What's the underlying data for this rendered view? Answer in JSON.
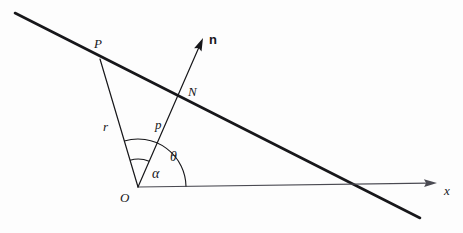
{
  "figure": {
    "type": "geometry-diagram",
    "background_color": "#fdfdfd",
    "stroke_color": "#17171a"
  },
  "labels": {
    "point_p": "P",
    "point_n": "N",
    "point_o": "O",
    "length_r": "r",
    "length_p": "p",
    "angle_theta": "θ",
    "angle_alpha": "α",
    "axis_x": "x",
    "vector_n": "n"
  },
  "geometry": {
    "origin": {
      "x": 138,
      "y": 187
    },
    "point_p": {
      "x": 100,
      "y": 59
    },
    "point_n": {
      "x": 181,
      "y": 98
    },
    "normal_arrow_tip": {
      "x": 203,
      "y": 38
    },
    "x_axis_arrow_tip": {
      "x": 437,
      "y": 183
    },
    "line_start": {
      "x": 15,
      "y": 13
    },
    "line_end": {
      "x": 420,
      "y": 218
    },
    "line_crosses_x_axis": {
      "x": 352,
      "y": 184
    },
    "arc_theta_radius": 48,
    "arc_alpha_radius": 28
  },
  "label_positions": {
    "point_p": {
      "x": 94,
      "y": 37
    },
    "point_n": {
      "x": 188,
      "y": 85
    },
    "point_o": {
      "x": 120,
      "y": 191
    },
    "length_r": {
      "x": 103,
      "y": 120
    },
    "length_p": {
      "x": 155,
      "y": 118
    },
    "angle_theta": {
      "x": 170,
      "y": 150
    },
    "angle_alpha": {
      "x": 152,
      "y": 167
    },
    "axis_x": {
      "x": 444,
      "y": 184
    },
    "vector_n": {
      "x": 209,
      "y": 33
    }
  },
  "strokes": {
    "main_line_width": 2.6,
    "construction_line_width": 1.2,
    "arc_line_width": 1.1,
    "axis_line_width": 1.2
  }
}
